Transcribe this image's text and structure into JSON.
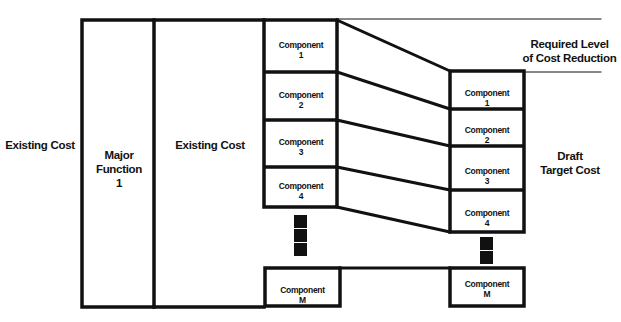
{
  "diagram": {
    "labels": {
      "existing_cost_outer": "Existing Cost",
      "major_function": [
        "Major",
        "Function",
        "1"
      ],
      "existing_cost_inner": "Existing Cost",
      "required_reduction": [
        "Required Level",
        "of Cost Reduction"
      ],
      "draft_target": [
        "Draft",
        "Target Cost"
      ]
    },
    "left_components": [
      {
        "name": "Component",
        "id": "1"
      },
      {
        "name": "Component",
        "id": "2"
      },
      {
        "name": "Component",
        "id": "3"
      },
      {
        "name": "Component",
        "id": "4"
      },
      {
        "name": "Component",
        "id": "M"
      }
    ],
    "right_components": [
      {
        "name": "Component",
        "id": "1"
      },
      {
        "name": "Component",
        "id": "2"
      },
      {
        "name": "Component",
        "id": "3"
      },
      {
        "name": "Component",
        "id": "4"
      },
      {
        "name": "Component",
        "id": "M"
      }
    ],
    "colors": {
      "stroke": "#111111",
      "background": "#ffffff"
    }
  }
}
